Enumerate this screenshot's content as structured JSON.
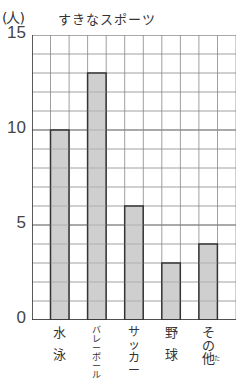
{
  "chart_data": {
    "type": "bar",
    "title": "すきなスポーツ",
    "ylabel": "(人)",
    "xlabel": "",
    "categories": [
      "水泳",
      "バレーボール",
      "サッカー",
      "野球",
      "その他"
    ],
    "values": [
      10,
      13,
      6,
      3,
      4
    ],
    "ylim": [
      0,
      15
    ],
    "yticks": [
      0,
      5,
      10,
      15
    ],
    "grid": true,
    "legend": null,
    "colors": {
      "bar_fill": "#cfcfcf",
      "bar_border": "#333333",
      "grid": "#888888",
      "grid_major": "#555555"
    }
  },
  "header": {
    "unit_label": "(人)",
    "title": "すきなスポーツ"
  },
  "y_axis": {
    "ticks": [
      {
        "label": "15",
        "value": 15
      },
      {
        "label": "10",
        "value": 10
      },
      {
        "label": "5",
        "value": 5
      },
      {
        "label": "0",
        "value": 0
      }
    ]
  },
  "x_axis": {
    "labels": [
      {
        "lines": [
          "水",
          "",
          "泳"
        ]
      },
      {
        "lines": [
          "バ",
          "レ",
          "ー",
          "ボ",
          "ー",
          "ル"
        ]
      },
      {
        "lines": [
          "サ",
          "ッ",
          "カ",
          "ー"
        ]
      },
      {
        "lines": [
          "野",
          "",
          "球"
        ]
      },
      {
        "lines": [
          "そ",
          "の",
          "他"
        ],
        "ruby": "た"
      }
    ]
  }
}
